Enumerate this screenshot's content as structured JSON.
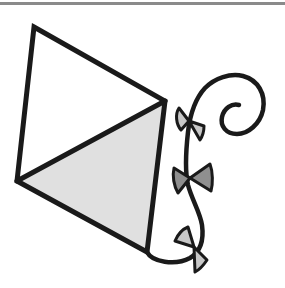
{
  "figure": {
    "title": "Kite illustration",
    "colors": {
      "outline": "#1a1a1a",
      "kite_shaded": "#e0e0e0",
      "kite_unshaded": "#ffffff",
      "bow_light": "#c8c8c8",
      "bow_dark": "#8f8f8f",
      "top_rule": "#8a8a8a",
      "background": "#ffffff"
    },
    "kite": {
      "vertices": {
        "top": [
          34,
          27
        ],
        "right": [
          165,
          101
        ],
        "bottom": [
          147,
          252
        ],
        "left": [
          17,
          181
        ]
      }
    },
    "tail": {
      "bows": [
        {
          "name": "top-bow",
          "fill": "light"
        },
        {
          "name": "middle-bow",
          "fill": "dark"
        },
        {
          "name": "bottom-bow",
          "fill": "light"
        }
      ]
    }
  }
}
